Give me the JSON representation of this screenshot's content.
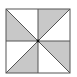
{
  "diagram": {
    "square": {
      "x": 6,
      "y": 9,
      "size": 64
    },
    "center": {
      "x": 38,
      "y": 41
    },
    "colors": {
      "shade": "#c8c8c8",
      "line": "#555555",
      "background": "#ffffff",
      "center_dot": "#111111"
    },
    "triangles": [
      {
        "id": "top-left-lower",
        "points": [
          [
            6,
            9
          ],
          [
            38,
            41
          ],
          [
            6,
            41
          ]
        ],
        "shaded": true
      },
      {
        "id": "top-left-upper",
        "points": [
          [
            6,
            9
          ],
          [
            38,
            9
          ],
          [
            38,
            41
          ]
        ],
        "shaded": false
      },
      {
        "id": "top-right-left",
        "points": [
          [
            38,
            9
          ],
          [
            70,
            9
          ],
          [
            38,
            41
          ]
        ],
        "shaded": true
      },
      {
        "id": "top-right-right",
        "points": [
          [
            70,
            9
          ],
          [
            70,
            41
          ],
          [
            38,
            41
          ]
        ],
        "shaded": false
      },
      {
        "id": "bottom-left-left",
        "points": [
          [
            6,
            41
          ],
          [
            38,
            41
          ],
          [
            6,
            73
          ]
        ],
        "shaded": false
      },
      {
        "id": "bottom-left-right",
        "points": [
          [
            38,
            41
          ],
          [
            38,
            73
          ],
          [
            6,
            73
          ]
        ],
        "shaded": true
      },
      {
        "id": "bottom-right-upper",
        "points": [
          [
            38,
            41
          ],
          [
            70,
            41
          ],
          [
            70,
            73
          ]
        ],
        "shaded": true
      },
      {
        "id": "bottom-right-lower",
        "points": [
          [
            38,
            41
          ],
          [
            70,
            73
          ],
          [
            38,
            73
          ]
        ],
        "shaded": false
      }
    ]
  }
}
